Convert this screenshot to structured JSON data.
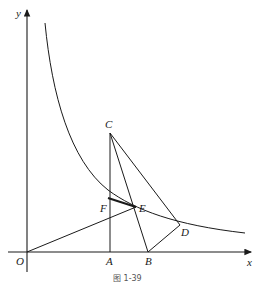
{
  "figure": {
    "caption": "图 1-39",
    "axes": {
      "x_label": "x",
      "y_label": "y",
      "origin_label": "O"
    },
    "points": {
      "O": "O",
      "A": "A",
      "B": "B",
      "C": "C",
      "D": "D",
      "E": "E",
      "F": "F"
    },
    "elements": [
      "hyperbola branch y = k/x in first quadrant",
      "segment OE",
      "segment CA (vertical)",
      "segment CB",
      "segment CD",
      "segment BD",
      "segment FE (thicker, on curve)"
    ]
  }
}
